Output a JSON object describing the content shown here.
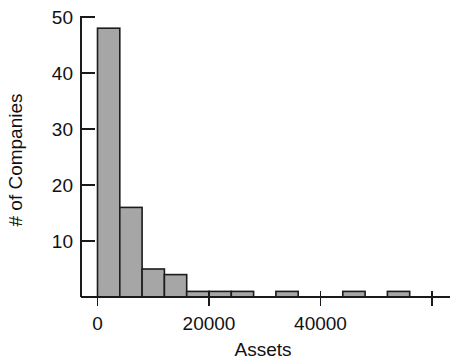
{
  "chart_data": {
    "type": "bar",
    "title": "",
    "subtitle": "",
    "xlabel": "Assets",
    "ylabel": "# of Companies",
    "xlim": [
      -2000,
      62000
    ],
    "ylim": [
      0,
      50
    ],
    "grid": false,
    "legend": null,
    "bin_width": 4000,
    "categories": [
      "0-4000",
      "4000-8000",
      "8000-12000",
      "12000-16000",
      "16000-20000",
      "20000-24000",
      "24000-28000",
      "28000-32000",
      "32000-36000",
      "36000-40000",
      "40000-44000",
      "44000-48000",
      "48000-52000",
      "52000-56000"
    ],
    "bin_starts": [
      0,
      4000,
      8000,
      12000,
      16000,
      20000,
      24000,
      28000,
      32000,
      36000,
      40000,
      44000,
      48000,
      52000
    ],
    "values": [
      48,
      16,
      5,
      4,
      1,
      1,
      1,
      0,
      1,
      0,
      0,
      1,
      0,
      1
    ],
    "xticks": [
      0,
      20000,
      40000,
      60000
    ],
    "xtick_labels": [
      "0",
      "20000",
      "40000",
      ""
    ],
    "yticks": [
      10,
      20,
      30,
      40,
      50
    ],
    "ytick_labels": [
      "10",
      "20",
      "30",
      "40",
      "50"
    ],
    "colors": {
      "bar_fill": "#a6a6a6",
      "bar_stroke": "#1c1c1c",
      "axis": "#1a1a1a",
      "text": "#111111",
      "background": "#ffffff"
    }
  },
  "axes": {
    "x_title": "Assets",
    "y_title": "# of Companies"
  }
}
